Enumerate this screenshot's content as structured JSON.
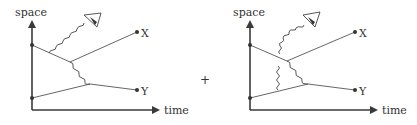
{
  "colors": {
    "ink": "#3a3a3a",
    "background": "#ffffff"
  },
  "operator": "+",
  "diagrams": [
    {
      "id": "left",
      "axis_labels": {
        "y": "space",
        "x": "time"
      },
      "endpoint_labels": {
        "top": "X",
        "bottom": "Y"
      },
      "description": "Two particles exchange a photon; one photon emitted toward observer eye"
    },
    {
      "id": "right",
      "axis_labels": {
        "y": "space",
        "x": "time"
      },
      "endpoint_labels": {
        "top": "X",
        "bottom": "Y"
      },
      "description": "Same interaction with additional internal photon exchange; emitted photon curves toward observer eye"
    }
  ]
}
